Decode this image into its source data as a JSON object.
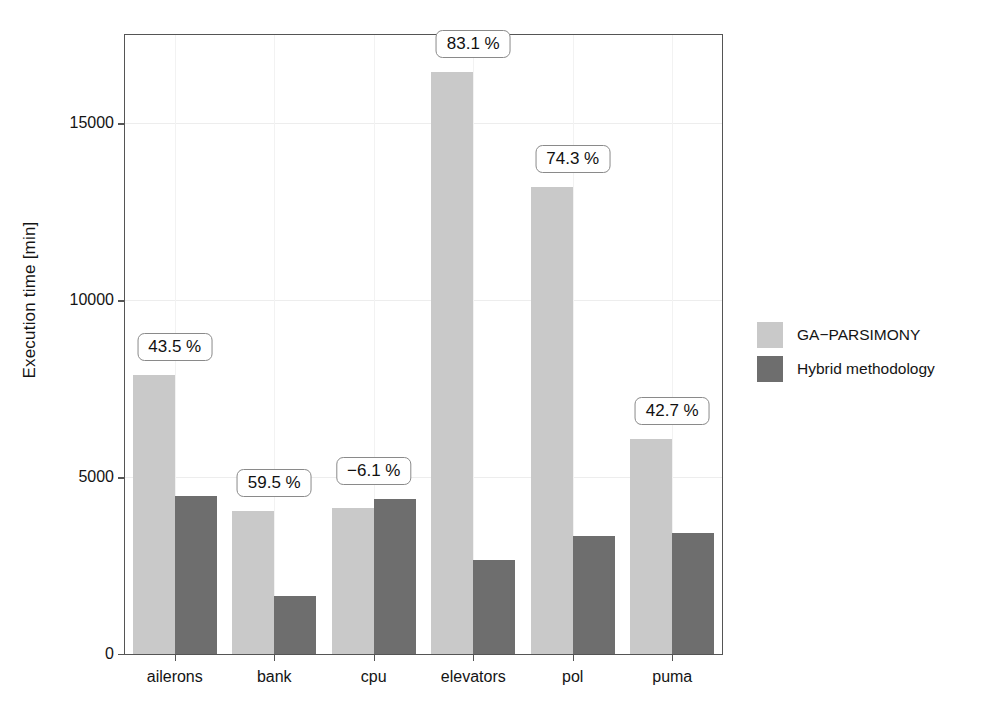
{
  "chart_data": {
    "type": "bar",
    "title": "",
    "xlabel": "",
    "ylabel": "Execution time [min]",
    "categories": [
      "ailerons",
      "bank",
      "cpu",
      "elevators",
      "pol",
      "puma"
    ],
    "series": [
      {
        "name": "GA-PARSIMONY",
        "color": "#c9c9c9",
        "values": [
          7900,
          4050,
          4120,
          16450,
          13200,
          6090
        ]
      },
      {
        "name": "Hybrid methodology",
        "color": "#6e6e6e",
        "values": [
          4470,
          1640,
          4370,
          2670,
          3330,
          3410
        ]
      }
    ],
    "annotations": [
      {
        "category": "ailerons",
        "text": "43.5 %"
      },
      {
        "category": "bank",
        "text": "59.5 %"
      },
      {
        "category": "cpu",
        "text": "−6.1 %"
      },
      {
        "category": "elevators",
        "text": "83.1 %"
      },
      {
        "category": "pol",
        "text": "74.3 %"
      },
      {
        "category": "puma",
        "text": "42.7 %"
      }
    ],
    "yticks": [
      0,
      5000,
      10000,
      15000
    ],
    "yticklabels": [
      "0",
      "5000",
      "10000",
      "15000"
    ],
    "ylim": [
      0,
      17500
    ],
    "grid": "major-faint",
    "legend_position": "right"
  },
  "legend": {
    "items": [
      {
        "label": "GA−PARSIMONY",
        "color": "#c9c9c9"
      },
      {
        "label": "Hybrid methodology",
        "color": "#6e6e6e"
      }
    ]
  },
  "axes": {
    "y_title": "Execution time [min]",
    "y_tick_labels": [
      "15000",
      "10000",
      "5000",
      "0"
    ],
    "x_tick_labels": [
      "ailerons",
      "bank",
      "cpu",
      "elevators",
      "pol",
      "puma"
    ]
  },
  "colors": {
    "light_bar": "#c9c9c9",
    "dark_bar": "#6e6e6e",
    "frame": "#555555",
    "grid": "#ededed",
    "text": "#141414"
  }
}
